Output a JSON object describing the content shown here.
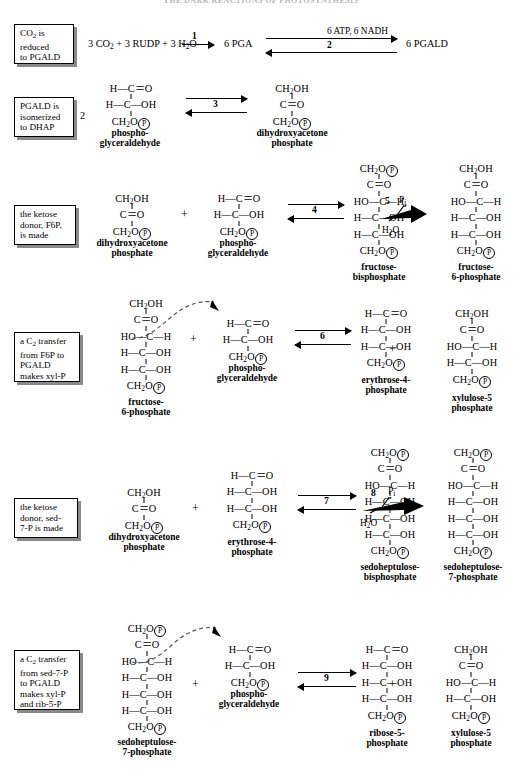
{
  "page": {
    "title": "THE DARK REACTIONS OF PHOTOSYNTHESIS"
  },
  "notes": [
    {
      "id": "note1",
      "lines": [
        "CO2 is",
        "reduced",
        "to PGALD"
      ]
    },
    {
      "id": "note2",
      "lines": [
        "PGALD is",
        "isomerized",
        "to DHAP"
      ]
    },
    {
      "id": "note3",
      "lines": [
        "the ketose",
        "donor, F6P,",
        "is made"
      ]
    },
    {
      "id": "note4",
      "lines": [
        "a C2 transfer",
        "from F6P to",
        "PGALD",
        "makes xyl-P"
      ]
    },
    {
      "id": "note5",
      "lines": [
        "the ketose",
        "donor, sed-",
        "7-P is made"
      ]
    },
    {
      "id": "note6",
      "lines": [
        "a C2 transfer",
        "from sed-7-P",
        "to PGALD",
        "makes xyl-P",
        "and rib-5-P"
      ]
    }
  ],
  "row1": {
    "reactants": "3 CO2 + 3 RUDP + 3 H2O",
    "step1_number": "1",
    "intermediate": "6 PGA",
    "step2_number": "2",
    "step2_cofactors": "6 ATP, 6 NADH",
    "product": "6 PGALD"
  },
  "row2": {
    "coefficient": "2",
    "step_number": "3",
    "left_caption": [
      "phospho-",
      "glyceraldehyde"
    ],
    "right_caption": [
      "dihydroxyacetone",
      "phosphate"
    ]
  },
  "row3": {
    "step4_number": "4",
    "step5_number": "5",
    "step5_in": "Pi",
    "step5_out": "H2O",
    "plus": "+",
    "cap_dhap": [
      "dihydroxyacetone",
      "phosphate"
    ],
    "cap_pgald": [
      "phospho-",
      "glyceraldehyde"
    ],
    "cap_fbp": [
      "fructose-",
      "bisphosphate"
    ],
    "cap_f6p": [
      "fructose-",
      "6-phosphate"
    ]
  },
  "row4": {
    "step6_number": "6",
    "plus_left": "+",
    "plus_right": "+",
    "cap_f6p": [
      "fructose-",
      "6-phosphate"
    ],
    "cap_pgald": [
      "phospho-",
      "glyceraldehyde"
    ],
    "cap_e4p": [
      "erythrose-4-",
      "phosphate"
    ],
    "cap_xu5p": [
      "xylulose-5",
      "phosphate"
    ]
  },
  "row5": {
    "step7_number": "7",
    "step8_number": "8",
    "step8_in": "Pi",
    "step8_out": "H2O",
    "plus": "+",
    "cap_dhap": [
      "dihydroxyacetone",
      "phosphate"
    ],
    "cap_e4p": [
      "erythrose-4-",
      "phosphate"
    ],
    "cap_sbp": [
      "sedoheptulose-",
      "bisphosphate"
    ],
    "cap_s7p": [
      "sedoheptulose-",
      "7-phosphate"
    ]
  },
  "row6": {
    "step9_number": "9",
    "plus_left": "+",
    "plus_right": "+",
    "cap_s7p": [
      "sedoheptulose-",
      "7-phosphate"
    ],
    "cap_pgald": [
      "phospho-",
      "glyceraldehyde"
    ],
    "cap_r5p": [
      "ribose-5-",
      "phosphate"
    ],
    "cap_xu5p": [
      "xylulose-5",
      "phosphate"
    ]
  },
  "molecules": {
    "pgald": [
      "H—C＝O",
      "H—C—OH",
      "CH2O-P"
    ],
    "dhap": [
      "CH2OH",
      "C＝O",
      "CH2O-P"
    ],
    "fbp": [
      "CH2O-P",
      "C＝O",
      "HO—C—H",
      "H—C—OH",
      "H—C—OH",
      "CH2O-P"
    ],
    "f6p": [
      "CH2OH",
      "C＝O",
      "HO—C—H",
      "H—C—OH",
      "H—C—OH",
      "CH2O-P"
    ],
    "e4p": [
      "H—C＝O",
      "H—C—OH",
      "H—C—OH",
      "CH2O-P"
    ],
    "xu5p": [
      "CH2OH",
      "C＝O",
      "HO—C—H",
      "H—C—OH",
      "CH2O-P"
    ],
    "sbp": [
      "CH2O-P",
      "C＝O",
      "HO—C—H",
      "H—C—OH",
      "H—C—OH",
      "H—C—OH",
      "CH2O-P"
    ],
    "s7p": [
      "CH2O-P",
      "C＝O",
      "HO—C—H",
      "H—C—OH",
      "H—C—OH",
      "H—C—OH",
      "CH2O-P"
    ],
    "r5p": [
      "H—C＝O",
      "H—C—OH",
      "H—C—OH",
      "H—C—OH",
      "CH2O-P"
    ]
  }
}
